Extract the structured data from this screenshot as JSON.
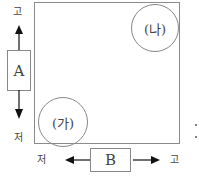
{
  "diagram": {
    "regions": [
      {
        "id": "ga",
        "label": "(가)",
        "position": "bottom-left"
      },
      {
        "id": "na",
        "label": "(나)",
        "position": "top-right"
      }
    ],
    "axes": {
      "vertical": {
        "box_label": "A",
        "high_label": "고",
        "low_label": "저"
      },
      "horizontal": {
        "box_label": "B",
        "high_label": "고",
        "low_label": "저"
      }
    },
    "side_marks": ":"
  }
}
